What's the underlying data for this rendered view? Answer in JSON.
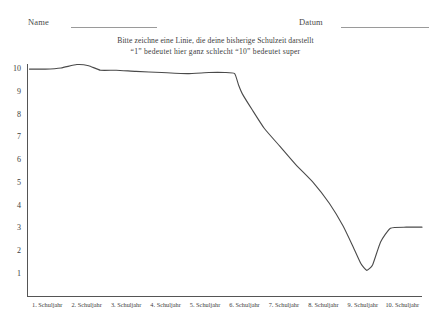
{
  "form": {
    "name_label": "Name",
    "date_label": "Datum"
  },
  "instructions": {
    "line1": "Bitte zeichne eine Linie, die deine bisherige Schulzeit darstellt",
    "line2": "“1” bedeutet hier ganz schlecht    “10” bedeutet super"
  },
  "chart_data": {
    "type": "line",
    "title": "Bitte zeichne eine Linie, die deine bisherige Schulzeit darstellt",
    "subtitle": "“1” bedeutet hier ganz schlecht    “10” bedeutet super",
    "xlabel": "",
    "ylabel": "",
    "grid": false,
    "legend": null,
    "ylim": [
      0,
      10.4
    ],
    "xlim": [
      0.5,
      10.5
    ],
    "yticks": [
      10,
      9,
      8,
      7,
      6,
      5,
      4,
      3,
      2,
      1
    ],
    "ytick_labels": [
      "10",
      "9",
      "8",
      "7",
      "6",
      "5",
      "4",
      "3",
      "2",
      "1"
    ],
    "categories": [
      "1. Schuljahr",
      "2. Schuljahr",
      "3. Schuljahr",
      "4. Schuljahr",
      "5. Schuljahr",
      "6. Schuljahr",
      "7. Schuljahr",
      "8. Schuljahr",
      "9. Schuljahr",
      "10. Schuljahr"
    ],
    "series": [
      {
        "name": "Schulzeit",
        "hand_drawn": true,
        "x": [
          0.55,
          0.95,
          1.35,
          1.75,
          2.05,
          2.35,
          2.75,
          3.25,
          3.9,
          4.55,
          5.1,
          5.5,
          5.75,
          5.85,
          5.95,
          6.2,
          6.5,
          6.9,
          7.3,
          7.75,
          8.15,
          8.5,
          8.75,
          8.95,
          9.1,
          9.25,
          9.45,
          9.7,
          10.1,
          10.5
        ],
        "values": [
          10.0,
          10.0,
          10.05,
          10.2,
          10.15,
          9.95,
          9.95,
          9.9,
          9.85,
          9.8,
          9.85,
          9.85,
          9.8,
          9.3,
          8.9,
          8.2,
          7.4,
          6.6,
          5.8,
          5.0,
          4.1,
          3.1,
          2.2,
          1.45,
          1.15,
          1.4,
          2.4,
          3.0,
          3.05,
          3.05
        ]
      }
    ]
  },
  "axis": {
    "line_color": "#555555",
    "stroke_color": "#4a4a4a"
  }
}
